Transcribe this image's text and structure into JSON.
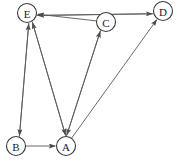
{
  "figure": {
    "name": "directed-graph",
    "width": 177,
    "height": 161,
    "background_color": "#ffffff",
    "edge_color": "#5a5a5a",
    "node_fill_color": "#ffffff",
    "node_stroke_color": "#3a3a3a",
    "label_color": "#1a1a1a",
    "node_radius": 9.5
  },
  "nodes": [
    {
      "id": "A",
      "label": "A",
      "x": 66,
      "y": 146
    },
    {
      "id": "B",
      "label": "B",
      "x": 16,
      "y": 146
    },
    {
      "id": "C",
      "label": "C",
      "x": 106,
      "y": 22
    },
    {
      "id": "D",
      "label": "D",
      "x": 163,
      "y": 11
    },
    {
      "id": "E",
      "label": "E",
      "x": 27,
      "y": 13
    }
  ],
  "edges": [
    {
      "id": "e1",
      "from": "E",
      "to": "D",
      "directed": true
    },
    {
      "id": "e2",
      "from": "D",
      "to": "E",
      "directed": true
    },
    {
      "id": "e3",
      "from": "C",
      "to": "E",
      "directed": true
    },
    {
      "id": "e4",
      "from": "B",
      "to": "E",
      "directed": true
    },
    {
      "id": "e5",
      "from": "A",
      "to": "E",
      "directed": true
    },
    {
      "id": "e6",
      "from": "E",
      "to": "B",
      "directed": true
    },
    {
      "id": "e7",
      "from": "E",
      "to": "A",
      "directed": true
    },
    {
      "id": "e8",
      "from": "B",
      "to": "A",
      "directed": true
    },
    {
      "id": "e9",
      "from": "C",
      "to": "A",
      "directed": true
    },
    {
      "id": "e10",
      "from": "A",
      "to": "C",
      "directed": true
    },
    {
      "id": "e11",
      "from": "A",
      "to": "D",
      "directed": true
    }
  ]
}
